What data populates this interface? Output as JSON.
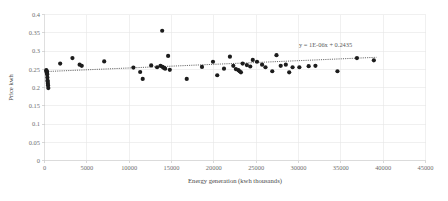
{
  "chart_data": {
    "type": "scatter",
    "title": "",
    "xlabel": "Energy generation  (kwh thousands)",
    "ylabel": "Price kwh",
    "xlim": [
      0,
      45000
    ],
    "ylim": [
      0,
      0.4
    ],
    "xticks": [
      0,
      5000,
      10000,
      15000,
      20000,
      25000,
      30000,
      35000,
      40000,
      45000
    ],
    "xtick_labels": [
      "0",
      "5000",
      "10000",
      "15000",
      "20000",
      "25000",
      "30000",
      "35000",
      "40000",
      "45000"
    ],
    "yticks": [
      0,
      0.05,
      0.1,
      0.15,
      0.2,
      0.25,
      0.3,
      0.35,
      0.4
    ],
    "ytick_labels": [
      "0",
      "0.05",
      "0.1",
      "0.15",
      "0.2",
      "0.25",
      "0.3",
      "0.35",
      "0.4"
    ],
    "grid": true,
    "legend": "none",
    "marker_color": "#1c1c1c",
    "marker_size": 2.1,
    "annotations": [
      {
        "name": "trendline-equation",
        "text": "y = 1E-06x + 0.2435",
        "x": 33200,
        "y": 0.312
      }
    ],
    "trendline": {
      "name": "linear-trendline",
      "equation": "y = 1E-06x + 0.2435",
      "slope": 1e-06,
      "intercept": 0.2435,
      "style": "dotted",
      "x_start": 200,
      "x_end": 39200
    },
    "points": [
      {
        "x": 210,
        "y": 0.2475
      },
      {
        "x": 240,
        "y": 0.2455
      },
      {
        "x": 260,
        "y": 0.2435
      },
      {
        "x": 280,
        "y": 0.2415
      },
      {
        "x": 300,
        "y": 0.2385
      },
      {
        "x": 320,
        "y": 0.2355
      },
      {
        "x": 340,
        "y": 0.2275
      },
      {
        "x": 360,
        "y": 0.2195
      },
      {
        "x": 380,
        "y": 0.2155
      },
      {
        "x": 400,
        "y": 0.2105
      },
      {
        "x": 420,
        "y": 0.2055
      },
      {
        "x": 450,
        "y": 0.1985
      },
      {
        "x": 1850,
        "y": 0.2655
      },
      {
        "x": 3300,
        "y": 0.2805
      },
      {
        "x": 4150,
        "y": 0.2625
      },
      {
        "x": 4400,
        "y": 0.2595
      },
      {
        "x": 7050,
        "y": 0.2715
      },
      {
        "x": 10500,
        "y": 0.2545
      },
      {
        "x": 11300,
        "y": 0.2425
      },
      {
        "x": 11600,
        "y": 0.2235
      },
      {
        "x": 12600,
        "y": 0.2605
      },
      {
        "x": 13300,
        "y": 0.2555
      },
      {
        "x": 13700,
        "y": 0.2595
      },
      {
        "x": 13900,
        "y": 0.3555
      },
      {
        "x": 13950,
        "y": 0.2565
      },
      {
        "x": 14100,
        "y": 0.2535
      },
      {
        "x": 14250,
        "y": 0.2515
      },
      {
        "x": 14600,
        "y": 0.2865
      },
      {
        "x": 14800,
        "y": 0.2485
      },
      {
        "x": 16800,
        "y": 0.2235
      },
      {
        "x": 18600,
        "y": 0.2565
      },
      {
        "x": 19900,
        "y": 0.2705
      },
      {
        "x": 20400,
        "y": 0.2335
      },
      {
        "x": 21200,
        "y": 0.2515
      },
      {
        "x": 21900,
        "y": 0.2845
      },
      {
        "x": 22300,
        "y": 0.2595
      },
      {
        "x": 22600,
        "y": 0.2505
      },
      {
        "x": 22900,
        "y": 0.2475
      },
      {
        "x": 23050,
        "y": 0.2445
      },
      {
        "x": 23200,
        "y": 0.2415
      },
      {
        "x": 23400,
        "y": 0.2655
      },
      {
        "x": 23900,
        "y": 0.2615
      },
      {
        "x": 24300,
        "y": 0.2575
      },
      {
        "x": 24600,
        "y": 0.2755
      },
      {
        "x": 25100,
        "y": 0.2705
      },
      {
        "x": 25700,
        "y": 0.2625
      },
      {
        "x": 26100,
        "y": 0.2555
      },
      {
        "x": 26900,
        "y": 0.2445
      },
      {
        "x": 27400,
        "y": 0.2885
      },
      {
        "x": 27900,
        "y": 0.2595
      },
      {
        "x": 28500,
        "y": 0.2625
      },
      {
        "x": 28900,
        "y": 0.2415
      },
      {
        "x": 29300,
        "y": 0.2555
      },
      {
        "x": 30100,
        "y": 0.2555
      },
      {
        "x": 31200,
        "y": 0.2585
      },
      {
        "x": 32000,
        "y": 0.2595
      },
      {
        "x": 34600,
        "y": 0.2445
      },
      {
        "x": 36900,
        "y": 0.2805
      },
      {
        "x": 38900,
        "y": 0.2745
      }
    ]
  }
}
